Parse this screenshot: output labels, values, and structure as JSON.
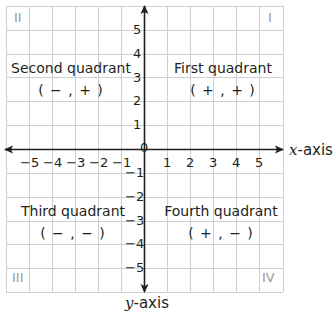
{
  "diagram": {
    "colors": {
      "grid": "#cfcfcf",
      "axis": "#231f20",
      "text": "#231f20",
      "roman": "#9a9a9a"
    },
    "axes": {
      "x_label_var": "x",
      "x_label_suffix": "-axis",
      "y_label_var": "y",
      "y_label_suffix": "-axis",
      "origin_label": "0",
      "x_ticks": [
        "−5",
        "−4",
        "−3",
        "−2",
        "−1",
        "1",
        "2",
        "3",
        "4",
        "5"
      ],
      "y_ticks": [
        "5",
        "4",
        "3",
        "2",
        "1",
        "−1",
        "−2",
        "−3",
        "−4",
        "−5"
      ]
    },
    "quadrants": [
      {
        "numeral": "I",
        "name": "First quadrant",
        "signs": "( + , + )"
      },
      {
        "numeral": "II",
        "name": "Second quadrant",
        "signs": "( − , + )"
      },
      {
        "numeral": "III",
        "name": "Third quadrant",
        "signs": "( − , − )"
      },
      {
        "numeral": "IV",
        "name": "Fourth quadrant",
        "signs": "( + , − )"
      }
    ]
  }
}
